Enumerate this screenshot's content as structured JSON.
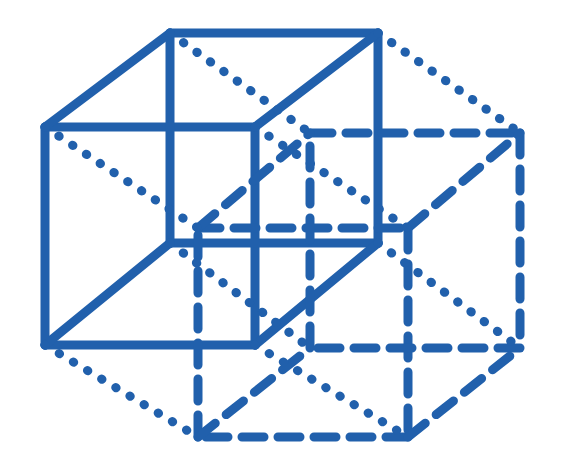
{
  "figure": {
    "canvas": {
      "width": 566,
      "height": 475,
      "background": "#ffffff"
    },
    "stroke": {
      "color": "#2160ac",
      "width": 9,
      "solid_label": "solid",
      "dashed_label": "dashed",
      "dotted_label": "dotted"
    },
    "styles": {
      "solid": {
        "dasharray": "",
        "linecap": "butt"
      },
      "dashed": {
        "dasharray": "22 14",
        "linecap": "round"
      },
      "dotted": {
        "dasharray": "0.5 16",
        "linecap": "round"
      }
    },
    "vertices": {
      "inner_front_top_left": [
        45,
        127
      ],
      "inner_front_top_right": [
        255,
        127
      ],
      "inner_front_bottom_left": [
        45,
        345
      ],
      "inner_front_bottom_right": [
        255,
        345
      ],
      "inner_back_top_left": [
        170,
        33
      ],
      "inner_back_top_right": [
        378,
        33
      ],
      "inner_back_bottom_left": [
        170,
        243
      ],
      "inner_back_bottom_right": [
        378,
        243
      ],
      "outer_front_top_left": [
        198,
        228
      ],
      "outer_front_top_right": [
        408,
        228
      ],
      "outer_front_bottom_left": [
        198,
        437
      ],
      "outer_front_bottom_right": [
        408,
        437
      ],
      "outer_back_top_left": [
        310,
        133
      ],
      "outer_back_top_right": [
        520,
        133
      ],
      "outer_back_bottom_left": [
        310,
        348
      ],
      "outer_back_bottom_right": [
        520,
        348
      ]
    },
    "edge_groups": [
      {
        "name": "inner-cube-front-face",
        "style": "solid",
        "edges": [
          [
            "inner_front_top_left",
            "inner_front_top_right"
          ],
          [
            "inner_front_top_right",
            "inner_front_bottom_right"
          ],
          [
            "inner_front_bottom_right",
            "inner_front_bottom_left"
          ],
          [
            "inner_front_bottom_left",
            "inner_front_top_left"
          ]
        ]
      },
      {
        "name": "inner-cube-back-face",
        "style": "solid",
        "edges": [
          [
            "inner_back_top_left",
            "inner_back_top_right"
          ],
          [
            "inner_back_top_right",
            "inner_back_bottom_right"
          ],
          [
            "inner_back_bottom_right",
            "inner_back_bottom_left"
          ],
          [
            "inner_back_bottom_left",
            "inner_back_top_left"
          ]
        ]
      },
      {
        "name": "inner-cube-connectors",
        "style": "solid",
        "edges": [
          [
            "inner_front_top_left",
            "inner_back_top_left"
          ],
          [
            "inner_front_top_right",
            "inner_back_top_right"
          ],
          [
            "inner_front_bottom_left",
            "inner_back_bottom_left"
          ],
          [
            "inner_front_bottom_right",
            "inner_back_bottom_right"
          ]
        ]
      },
      {
        "name": "outer-cube-front-face",
        "style": "dashed",
        "edges": [
          [
            "outer_front_top_left",
            "outer_front_top_right"
          ],
          [
            "outer_front_top_right",
            "outer_front_bottom_right"
          ],
          [
            "outer_front_bottom_right",
            "outer_front_bottom_left"
          ],
          [
            "outer_front_bottom_left",
            "outer_front_top_left"
          ]
        ]
      },
      {
        "name": "outer-cube-back-face",
        "style": "dashed",
        "edges": [
          [
            "outer_back_top_left",
            "outer_back_top_right"
          ],
          [
            "outer_back_top_right",
            "outer_back_bottom_right"
          ],
          [
            "outer_back_bottom_right",
            "outer_back_bottom_left"
          ],
          [
            "outer_back_bottom_left",
            "outer_back_top_left"
          ]
        ]
      },
      {
        "name": "outer-cube-connectors",
        "style": "dashed",
        "edges": [
          [
            "outer_front_top_left",
            "outer_back_top_left"
          ],
          [
            "outer_front_top_right",
            "outer_back_top_right"
          ],
          [
            "outer_front_bottom_left",
            "outer_back_bottom_left"
          ],
          [
            "outer_front_bottom_right",
            "outer_back_bottom_right"
          ]
        ]
      },
      {
        "name": "hyper-connectors",
        "style": "dotted",
        "edges": [
          [
            "inner_front_top_left",
            "outer_front_top_left"
          ],
          [
            "inner_front_top_right",
            "outer_front_top_right"
          ],
          [
            "inner_front_bottom_left",
            "outer_front_bottom_left"
          ],
          [
            "inner_front_bottom_right",
            "outer_front_bottom_right"
          ],
          [
            "inner_back_top_left",
            "outer_back_top_left"
          ],
          [
            "inner_back_top_right",
            "outer_back_top_right"
          ],
          [
            "inner_back_bottom_left",
            "outer_back_bottom_left"
          ],
          [
            "inner_back_bottom_right",
            "outer_back_bottom_right"
          ]
        ]
      }
    ]
  }
}
